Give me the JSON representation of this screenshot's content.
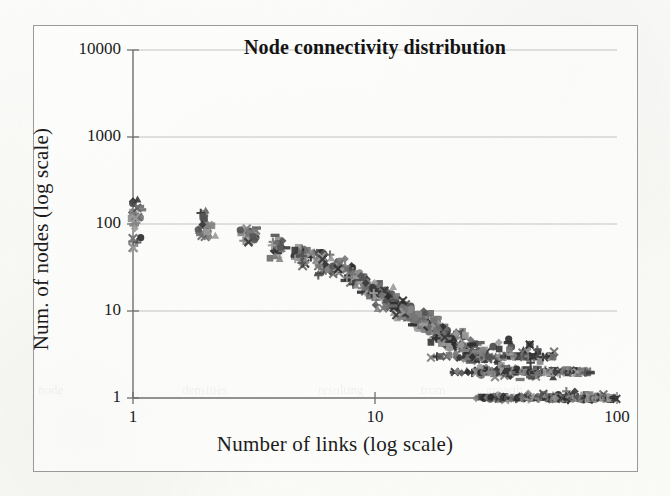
{
  "figure": {
    "kind": "scanned-figure",
    "background_color": "#fbfbf8",
    "frame_color": "#9a9a9a"
  },
  "chart_data": {
    "type": "scatter",
    "title": "Node connectivity distribution",
    "xlabel": "Number of links (log scale)",
    "ylabel": "Num. of nodes (log scale)",
    "xscale": "log",
    "yscale": "log",
    "xlim": [
      1,
      100
    ],
    "ylim": [
      1,
      10000
    ],
    "xticks": [
      1,
      10,
      100
    ],
    "xtick_labels": [
      "1",
      "10",
      "100"
    ],
    "yticks": [
      1,
      10,
      100,
      1000,
      10000
    ],
    "ytick_labels": [
      "1",
      "10",
      "100",
      "1000",
      "10000"
    ],
    "grid": "horizontal-major",
    "grid_color": "#b9b9b9",
    "legend": "none",
    "marker_palette": [
      "#3a3a3a",
      "#555555",
      "#6e6e6e",
      "#858585",
      "#9b9b9b",
      "#2e2e2e",
      "#777777"
    ],
    "marker_shapes": [
      "diamond",
      "square",
      "triangle",
      "cross",
      "plus",
      "circle",
      "dash"
    ],
    "series": [
      {
        "name": "sample-1",
        "shape": "diamond",
        "color": "#2e2e2e",
        "points": [
          [
            1,
            180
          ],
          [
            1,
            130
          ],
          [
            2,
            120
          ],
          [
            2,
            88
          ],
          [
            3,
            78
          ],
          [
            4,
            55
          ],
          [
            5,
            45
          ],
          [
            6,
            42
          ],
          [
            7,
            32
          ],
          [
            8,
            26
          ],
          [
            9,
            20
          ],
          [
            10,
            16
          ],
          [
            11,
            14
          ],
          [
            12,
            12
          ],
          [
            13,
            11
          ],
          [
            14,
            9
          ],
          [
            15,
            8
          ],
          [
            16,
            7
          ],
          [
            17,
            6
          ],
          [
            18,
            5
          ],
          [
            19,
            5
          ],
          [
            20,
            4
          ],
          [
            21,
            4
          ],
          [
            22,
            3
          ],
          [
            24,
            3
          ],
          [
            26,
            2
          ],
          [
            30,
            2
          ],
          [
            34,
            1
          ],
          [
            40,
            1
          ],
          [
            46,
            1
          ],
          [
            52,
            1
          ]
        ]
      },
      {
        "name": "sample-2",
        "shape": "square",
        "color": "#8d8d8d",
        "points": [
          [
            1,
            140
          ],
          [
            1,
            120
          ],
          [
            2,
            135
          ],
          [
            2,
            92
          ],
          [
            3,
            80
          ],
          [
            4,
            62
          ],
          [
            5,
            48
          ],
          [
            6,
            40
          ],
          [
            7,
            34
          ],
          [
            8,
            28
          ],
          [
            9,
            22
          ],
          [
            10,
            18
          ],
          [
            11,
            15
          ],
          [
            12,
            13
          ],
          [
            13,
            11
          ],
          [
            14,
            10
          ],
          [
            15,
            8
          ],
          [
            16,
            7
          ],
          [
            17,
            7
          ],
          [
            18,
            6
          ],
          [
            20,
            5
          ],
          [
            22,
            4
          ],
          [
            24,
            4
          ],
          [
            26,
            3
          ],
          [
            28,
            3
          ],
          [
            32,
            2
          ],
          [
            36,
            2
          ],
          [
            42,
            2
          ],
          [
            48,
            1
          ],
          [
            56,
            1
          ],
          [
            64,
            1
          ]
        ]
      },
      {
        "name": "sample-3",
        "shape": "cross",
        "color": "#6b6b6b",
        "points": [
          [
            1,
            70
          ],
          [
            1,
            52
          ],
          [
            2,
            75
          ],
          [
            3,
            66
          ],
          [
            4,
            50
          ],
          [
            5,
            33
          ],
          [
            6,
            30
          ],
          [
            7,
            27
          ],
          [
            8,
            22
          ],
          [
            9,
            17
          ],
          [
            10,
            15
          ],
          [
            11,
            13
          ],
          [
            12,
            11
          ],
          [
            13,
            10
          ],
          [
            14,
            9
          ],
          [
            15,
            8
          ],
          [
            16,
            7
          ],
          [
            18,
            6
          ],
          [
            20,
            5
          ],
          [
            22,
            4
          ],
          [
            25,
            3
          ],
          [
            28,
            3
          ],
          [
            33,
            2
          ],
          [
            38,
            2
          ],
          [
            45,
            2
          ],
          [
            55,
            1
          ],
          [
            66,
            1
          ],
          [
            75,
            1
          ]
        ]
      },
      {
        "name": "sample-4",
        "shape": "plus",
        "color": "#7a7a7a",
        "points": [
          [
            1,
            62
          ],
          [
            2,
            80
          ],
          [
            3,
            72
          ],
          [
            4,
            54
          ],
          [
            5,
            46
          ],
          [
            6,
            44
          ],
          [
            7,
            35
          ],
          [
            8,
            24
          ],
          [
            9,
            19
          ],
          [
            10,
            17
          ],
          [
            11,
            16
          ],
          [
            12,
            12
          ],
          [
            13,
            12
          ],
          [
            14,
            10
          ],
          [
            15,
            9
          ],
          [
            16,
            8
          ],
          [
            17,
            8
          ],
          [
            19,
            6
          ],
          [
            21,
            5
          ],
          [
            23,
            5
          ],
          [
            26,
            4
          ],
          [
            29,
            3
          ],
          [
            34,
            3
          ],
          [
            41,
            2
          ],
          [
            50,
            2
          ],
          [
            58,
            2
          ],
          [
            70,
            2
          ],
          [
            80,
            1
          ],
          [
            88,
            1
          ]
        ]
      },
      {
        "name": "sample-5",
        "shape": "circle",
        "color": "#4a4a4a",
        "points": [
          [
            1,
            170
          ],
          [
            2,
            95
          ],
          [
            3,
            82
          ],
          [
            4,
            58
          ],
          [
            5,
            52
          ],
          [
            6,
            47
          ],
          [
            7,
            36
          ],
          [
            8,
            30
          ],
          [
            9,
            24
          ],
          [
            10,
            19
          ],
          [
            11,
            17
          ],
          [
            12,
            14
          ],
          [
            13,
            12
          ],
          [
            14,
            11
          ],
          [
            15,
            9
          ],
          [
            16,
            9
          ],
          [
            18,
            7
          ],
          [
            20,
            6
          ],
          [
            23,
            5
          ],
          [
            26,
            4
          ],
          [
            31,
            4
          ],
          [
            37,
            4
          ],
          [
            44,
            4
          ],
          [
            52,
            3
          ],
          [
            60,
            1
          ],
          [
            72,
            1
          ],
          [
            84,
            1
          ]
        ]
      },
      {
        "name": "sample-6",
        "shape": "triangle",
        "color": "#9c9c9c",
        "points": [
          [
            1,
            110
          ],
          [
            2,
            86
          ],
          [
            3,
            70
          ],
          [
            4,
            44
          ],
          [
            5,
            38
          ],
          [
            6,
            33
          ],
          [
            7,
            29
          ],
          [
            8,
            25
          ],
          [
            9,
            21
          ],
          [
            10,
            14
          ],
          [
            11,
            12
          ],
          [
            12,
            10
          ],
          [
            13,
            9
          ],
          [
            14,
            8
          ],
          [
            15,
            7
          ],
          [
            17,
            6
          ],
          [
            19,
            5
          ],
          [
            21,
            4
          ],
          [
            24,
            3
          ],
          [
            27,
            3
          ],
          [
            31,
            3
          ],
          [
            36,
            3
          ],
          [
            43,
            3
          ],
          [
            50,
            3
          ],
          [
            58,
            2
          ],
          [
            68,
            2
          ],
          [
            78,
            1
          ],
          [
            90,
            1
          ]
        ]
      },
      {
        "name": "sample-7",
        "shape": "dash",
        "color": "#868686",
        "points": [
          [
            1,
            98
          ],
          [
            2,
            78
          ],
          [
            3,
            68
          ],
          [
            4,
            48
          ],
          [
            5,
            40
          ],
          [
            6,
            36
          ],
          [
            7,
            31
          ],
          [
            8,
            23
          ],
          [
            9,
            18
          ],
          [
            10,
            16
          ],
          [
            11,
            13
          ],
          [
            12,
            11
          ],
          [
            13,
            10
          ],
          [
            14,
            9
          ],
          [
            15,
            8
          ],
          [
            16,
            6
          ],
          [
            18,
            5
          ],
          [
            21,
            5
          ],
          [
            24,
            4
          ],
          [
            28,
            3
          ],
          [
            32,
            2
          ],
          [
            38,
            2
          ],
          [
            44,
            2
          ],
          [
            54,
            1
          ],
          [
            62,
            1
          ],
          [
            70,
            1
          ],
          [
            82,
            1
          ],
          [
            94,
            1
          ]
        ]
      }
    ]
  },
  "ghost_text": [
    {
      "text": "node",
      "x": 38,
      "y": 382
    },
    {
      "text": "densities",
      "x": 182,
      "y": 382
    },
    {
      "text": "resulting",
      "x": 318,
      "y": 382
    },
    {
      "text": "from",
      "x": 420,
      "y": 382
    },
    {
      "text": "growth",
      "x": 486,
      "y": 382
    }
  ]
}
